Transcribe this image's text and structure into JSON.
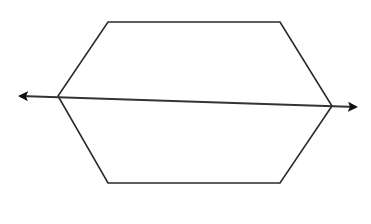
{
  "diagram": {
    "stroke_color": "#2a2a2a",
    "fill_color": "#ffffff",
    "hexagon": {
      "points": [
        [
          108,
          22
        ],
        [
          280,
          22
        ],
        [
          332,
          106
        ],
        [
          280,
          183
        ],
        [
          108,
          183
        ],
        [
          58,
          96
        ]
      ]
    },
    "arrow": {
      "start": [
        20,
        96
      ],
      "end": [
        356,
        107
      ],
      "heads": "both"
    }
  }
}
